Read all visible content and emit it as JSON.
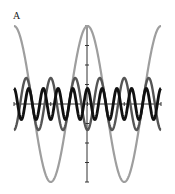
{
  "panel": {
    "label": "A"
  },
  "chart_data": {
    "type": "line",
    "title": "",
    "xlabel": "",
    "ylabel": "",
    "grid": false,
    "legend": null,
    "xlim": [
      -6.283,
      6.283
    ],
    "ylim": [
      -1.0,
      1.0
    ],
    "x_ticks": [
      -6.283,
      -3.1416,
      0,
      3.1416,
      6.283
    ],
    "y_ticks": [
      -1.0,
      -0.75,
      -0.5,
      -0.25,
      0.25,
      0.5,
      0.75,
      1.0
    ],
    "series": [
      {
        "name": "cos(x)",
        "frequency": 1,
        "amplitude": 1.0,
        "phase_sign": 1,
        "color": "#9e9e9e",
        "stroke_width": 2.2
      },
      {
        "name": "-cos(3x)/3",
        "frequency": 3,
        "amplitude": 0.3333,
        "phase_sign": -1,
        "color": "#555555",
        "stroke_width": 2.4
      },
      {
        "name": "cos(5x)/5",
        "frequency": 5,
        "amplitude": 0.2,
        "phase_sign": 1,
        "color": "#111111",
        "stroke_width": 2.8
      }
    ]
  }
}
